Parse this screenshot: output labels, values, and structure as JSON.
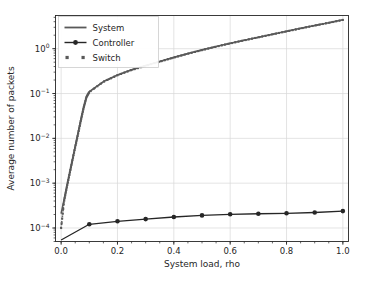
{
  "figure": {
    "background_color": "#ffffff",
    "axes_color": "#262626",
    "grid_color": "#d9d9d9",
    "width": 373,
    "height": 284
  },
  "chart_data": {
    "type": "line",
    "title": "",
    "xlabel": "System load, rho",
    "ylabel": "Average number of packets",
    "xscale": "linear",
    "yscale": "log",
    "xlim": [
      -0.02,
      1.02
    ],
    "ylim": [
      5e-05,
      5.5
    ],
    "grid": true,
    "xticks": [
      0.0,
      0.2,
      0.4,
      0.6,
      0.8,
      1.0
    ],
    "xticklabels": [
      "0.0",
      "0.2",
      "0.4",
      "0.6",
      "0.8",
      "1.0"
    ],
    "yticks": [
      0.0001,
      0.001,
      0.01,
      0.1,
      1.0
    ],
    "yticklabels": [
      "10−4",
      "10−3",
      "10−2",
      "10−1",
      "10⁰"
    ],
    "ytick_mantissas": [
      "10",
      "10",
      "10",
      "10",
      "10"
    ],
    "ytick_exponents": [
      "-4",
      "-3",
      "-2",
      "-1",
      "0"
    ],
    "legend": {
      "position": "upper left",
      "entries": [
        {
          "name": "System",
          "style": "line",
          "color": "#595959"
        },
        {
          "name": "Controller",
          "style": "line-marker-circle",
          "color": "#262626"
        },
        {
          "name": "Switch",
          "style": "marker-square",
          "color": "#595959"
        }
      ]
    },
    "series": [
      {
        "name": "System",
        "color": "#595959",
        "style": "solid",
        "linewidth": 1.6,
        "x": [
          0.0,
          0.01,
          0.02,
          0.03,
          0.04,
          0.05,
          0.06,
          0.07,
          0.08,
          0.09,
          0.1,
          0.15,
          0.2,
          0.25,
          0.3,
          0.35,
          0.4,
          0.45,
          0.5,
          0.55,
          0.6,
          0.65,
          0.7,
          0.75,
          0.8,
          0.85,
          0.9,
          0.95,
          1.0
        ],
        "y": [
          0.00021,
          0.00042,
          0.00085,
          0.0017,
          0.0034,
          0.0067,
          0.013,
          0.026,
          0.05,
          0.085,
          0.11,
          0.185,
          0.26,
          0.34,
          0.42,
          0.52,
          0.64,
          0.78,
          0.94,
          1.12,
          1.32,
          1.55,
          1.8,
          2.1,
          2.45,
          2.85,
          3.3,
          3.8,
          4.4
        ]
      },
      {
        "name": "Switch",
        "color": "#595959",
        "style": "dotted-square",
        "linewidth": 1.6,
        "x": [
          0.0,
          0.01,
          0.02,
          0.03,
          0.04,
          0.05,
          0.06,
          0.07,
          0.08,
          0.09,
          0.1,
          0.15,
          0.2,
          0.25,
          0.3,
          0.35,
          0.4,
          0.45,
          0.5,
          0.55,
          0.6,
          0.65,
          0.7,
          0.75,
          0.8,
          0.85,
          0.9,
          0.95,
          1.0
        ],
        "y": [
          0.0001,
          0.00038,
          0.0008,
          0.0016,
          0.0032,
          0.0064,
          0.0125,
          0.025,
          0.048,
          0.083,
          0.108,
          0.182,
          0.256,
          0.335,
          0.415,
          0.515,
          0.633,
          0.772,
          0.93,
          1.11,
          1.31,
          1.54,
          1.79,
          2.09,
          2.43,
          2.83,
          3.28,
          3.78,
          4.38
        ]
      },
      {
        "name": "Controller",
        "color": "#262626",
        "style": "solid-circle",
        "linewidth": 1.3,
        "x": [
          0.0,
          0.1,
          0.2,
          0.3,
          0.4,
          0.5,
          0.6,
          0.7,
          0.8,
          0.9,
          1.0
        ],
        "y": [
          5.4e-05,
          0.000121,
          0.000141,
          0.000158,
          0.000176,
          0.000191,
          0.000202,
          0.000208,
          0.000213,
          0.000222,
          0.000238
        ]
      }
    ]
  }
}
